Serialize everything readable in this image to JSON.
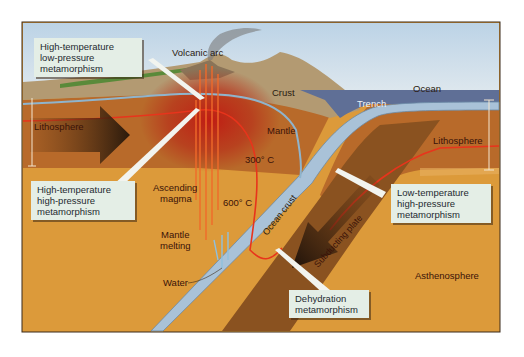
{
  "diagram": {
    "type": "subduction-zone cross-section",
    "labels": {
      "volcanic_arc": "Volcanic arc",
      "crust": "Crust",
      "ocean": "Ocean",
      "trench": "Trench",
      "mantle": "Mantle",
      "lithosphere_left": "Lithosphere",
      "lithosphere_right": "Lithosphere",
      "temp_300": "300° C",
      "temp_600": "600° C",
      "ascending_magma_1": "Ascending",
      "ascending_magma_2": "magma",
      "mantle_melting_1": "Mantle",
      "mantle_melting_2": "melting",
      "water": "Water",
      "ocean_crust": "Ocean crust",
      "subducting_plate": "Subducting plate",
      "asthenosphere": "Asthenosphere"
    },
    "callouts": [
      {
        "id": "ht-lp",
        "lines": [
          "High-temperature",
          "low-pressure",
          "metamorphism"
        ]
      },
      {
        "id": "ht-hp",
        "lines": [
          "High-temperature",
          "high-pressure",
          "metamorphism"
        ]
      },
      {
        "id": "lt-hp",
        "lines": [
          "Low-temperature",
          "high-pressure",
          "metamorphism"
        ]
      },
      {
        "id": "dehydration",
        "lines": [
          "Dehydration",
          "metamorphism"
        ]
      }
    ],
    "colors": {
      "sky": "#cfe0ec",
      "crust": "#b39a72",
      "mantle": "#b86a2a",
      "asthenosphere": "#dc9a3a",
      "hot_zone": "#c8281a",
      "ocean": "#5f6f96",
      "ocean_crust": "#a9c2d8",
      "isotherm": "#e8341c",
      "callout_bg": "#e4eee6"
    }
  }
}
